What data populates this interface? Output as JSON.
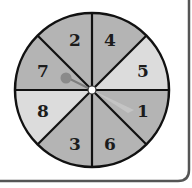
{
  "spinner": {
    "sections": [
      {
        "label": "2",
        "shade": "medium",
        "color": "#b4b4b4"
      },
      {
        "label": "4",
        "shade": "medium",
        "color": "#b4b4b4"
      },
      {
        "label": "5",
        "shade": "light",
        "color": "#dcdcdc"
      },
      {
        "label": "1",
        "shade": "medium",
        "color": "#b4b4b4"
      },
      {
        "label": "6",
        "shade": "medium",
        "color": "#b4b4b4"
      },
      {
        "label": "3",
        "shade": "medium",
        "color": "#b4b4b4"
      },
      {
        "label": "8",
        "shade": "light",
        "color": "#dcdcdc"
      },
      {
        "label": "7",
        "shade": "medium",
        "color": "#b4b4b4"
      }
    ],
    "pointer_points_to": "1",
    "colors": {
      "outline": "#111111",
      "pointer": "#8a8a8a",
      "hub": "#ffffff"
    }
  }
}
